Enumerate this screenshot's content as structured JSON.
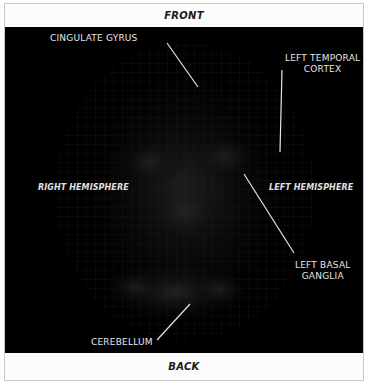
{
  "orientation": {
    "top_label": "FRONT",
    "bottom_label": "BACK",
    "left_label": "RIGHT HEMISPHERE",
    "right_label": "LEFT HEMISPHERE"
  },
  "annotations": [
    {
      "id": "cingulate-gyrus",
      "text": "CINGULATE GYRUS"
    },
    {
      "id": "left-temporal-cortex",
      "text": "LEFT TEMPORAL CORTEX",
      "line1": "LEFT TEMPORAL",
      "line2": "CORTEX"
    },
    {
      "id": "left-basal-ganglia",
      "text": "LEFT BASAL GANGLIA",
      "line1": "LEFT BASAL",
      "line2": "GANGLIA"
    },
    {
      "id": "cerebellum",
      "text": "CEREBELLUM"
    }
  ],
  "colors": {
    "scan_background": "#000000",
    "label_text": "#e6e6e6",
    "bar_background": "#fbfbfb",
    "border": "#c8c8c8"
  }
}
